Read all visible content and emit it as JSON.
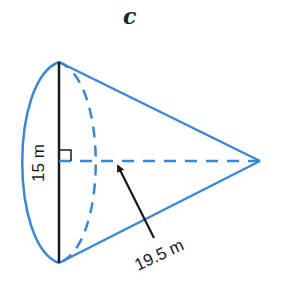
{
  "figure": {
    "label": "c",
    "shape": "cone",
    "diameter_label": "15 m",
    "slant_height_label": "19.5 m",
    "colors": {
      "outline": "#3a87d4",
      "diameter_line": "#1a1a1a",
      "arrow": "#1a1a1a"
    }
  }
}
